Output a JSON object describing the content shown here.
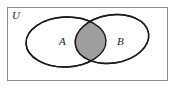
{
  "figure": {
    "type": "venn-diagram",
    "caption_present": false,
    "background_color": "#ffffff"
  },
  "universe": {
    "label": "U",
    "label_x": 12,
    "label_y": 18,
    "border_color": "#8c8c8c",
    "fill_color": "#ffffff",
    "rect": {
      "x": 7.5,
      "y": 7.5,
      "width": 160,
      "height": 73
    }
  },
  "sets": [
    {
      "name": "set-a",
      "label": "A",
      "label_x": 59,
      "label_y": 44,
      "outline_color": "#1a1a1a",
      "fill_color": "#ffffff",
      "shape": "rounded-ellipse",
      "cx": 66,
      "cy": 42,
      "rx": 40,
      "ry": 25,
      "rotation": -2
    },
    {
      "name": "set-b",
      "label": "B",
      "label_x": 117,
      "label_y": 44,
      "outline_color": "#1a1a1a",
      "fill_color": "#ffffff",
      "shape": "ellipse",
      "cx": 112,
      "cy": 39,
      "rx": 37,
      "ry": 24,
      "rotation": -9
    }
  ],
  "shaded_region": {
    "name": "a-intersect-b",
    "description": "intersection",
    "fill_color": "#9e9e9e",
    "outline_color": "#1a1a1a"
  }
}
